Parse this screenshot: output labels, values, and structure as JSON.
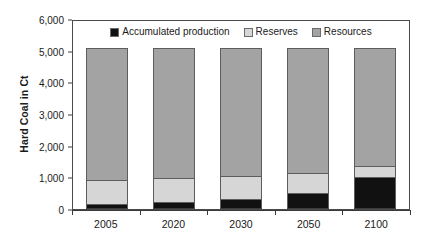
{
  "chart_data": {
    "type": "bar",
    "stacked": true,
    "title": "",
    "xlabel": "",
    "ylabel": "Hard Coal in Ct",
    "categories": [
      "2005",
      "2020",
      "2030",
      "2050",
      "2100"
    ],
    "ylim": [
      0,
      6000
    ],
    "yticks": [
      0,
      1000,
      2000,
      3000,
      4000,
      5000,
      6000
    ],
    "ytick_labels": [
      "0",
      "1,000",
      "2,000",
      "3,000",
      "4,000",
      "5,000",
      "6,000"
    ],
    "grid": false,
    "legend_position": "top-center",
    "series": [
      {
        "name": "Accumulated production",
        "color": "#111111",
        "values": [
          150,
          230,
          330,
          520,
          1020
        ]
      },
      {
        "name": "Reserves",
        "color": "#d6d6d6",
        "values": [
          770,
          740,
          700,
          610,
          330
        ]
      },
      {
        "name": "Resources",
        "color": "#a3a3a3",
        "values": [
          4180,
          4130,
          4070,
          3970,
          3750
        ]
      }
    ],
    "totals": [
      5100,
      5100,
      5100,
      5100,
      5100
    ],
    "cumulative_tops": {
      "production": [
        150,
        230,
        330,
        520,
        1020
      ],
      "reserves": [
        920,
        970,
        1030,
        1130,
        1350
      ],
      "resources": [
        5100,
        5100,
        5100,
        5100,
        5100
      ]
    }
  },
  "axis": {
    "y_title": "Hard Coal in Ct"
  },
  "legend": {
    "items": [
      {
        "label": "Accumulated production",
        "swatch": "#111111"
      },
      {
        "label": "Reserves",
        "swatch": "#d6d6d6"
      },
      {
        "label": "Resources",
        "swatch": "#a3a3a3"
      }
    ]
  }
}
